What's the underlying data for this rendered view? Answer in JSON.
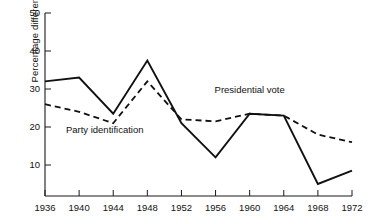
{
  "chart_data": {
    "type": "line",
    "title": "",
    "subtitle": "",
    "xlabel": "",
    "ylabel": "Percentage difference",
    "x": [
      1936,
      1940,
      1944,
      1948,
      1952,
      1956,
      1960,
      1964,
      1968,
      1972
    ],
    "xtick_labels": [
      "1936",
      "1940",
      "1944",
      "1948",
      "1952",
      "1956",
      "1960",
      "1964",
      "1968",
      "1972"
    ],
    "ytick_labels": [
      "10",
      "20",
      "30",
      "40",
      "50"
    ],
    "yticks": [
      10,
      20,
      30,
      40,
      50
    ],
    "ylim": [
      0,
      50
    ],
    "xlim": [
      1936,
      1972
    ],
    "grid": false,
    "legend_position": "inline-annotations",
    "series": [
      {
        "name": "Presidential vote",
        "style": "solid",
        "color": "#111111",
        "values": [
          32,
          33,
          23.5,
          37.5,
          21,
          12,
          23.5,
          23,
          5,
          8.5
        ],
        "label_x": 1960,
        "label_y": 29
      },
      {
        "name": "Party identification",
        "style": "dashed",
        "color": "#111111",
        "values": [
          26,
          24,
          21,
          32,
          22,
          21.5,
          23.5,
          23,
          18,
          16
        ],
        "label_x": 1943,
        "label_y": 18.5
      }
    ],
    "annotations": [
      {
        "text": "Presidential vote",
        "x": 1960,
        "y": 29
      },
      {
        "text": "Party identification",
        "x": 1943,
        "y": 18.5
      }
    ]
  }
}
